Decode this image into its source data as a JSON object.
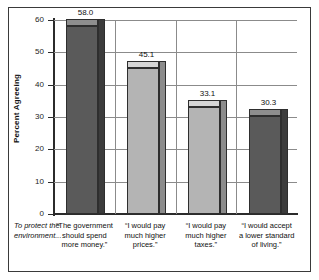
{
  "chart_data": {
    "type": "bar",
    "title": "",
    "xlabel": "",
    "ylabel": "Percent Agreeing",
    "ylim": [
      0,
      60
    ],
    "ytick_labels": [
      "0",
      "10",
      "20",
      "30",
      "40",
      "50",
      "60"
    ],
    "ytick_values": [
      0,
      10,
      20,
      30,
      40,
      50,
      60
    ],
    "grid": "horizontal-and-vertical",
    "legend": "none",
    "intro_label": "To protect the environment...",
    "categories": [
      "“The government should spend more money.”",
      "“I would pay much higher prices.”",
      "“I would pay much higher taxes.”",
      "“I would accept a lower standard of living.”"
    ],
    "category_lines": [
      [
        "“The government",
        "should spend",
        "more money.”"
      ],
      [
        "“I would pay",
        "much higher",
        "prices.”"
      ],
      [
        "“I would pay",
        "much higher",
        "taxes.”"
      ],
      [
        "“I would accept",
        "a lower standard",
        "of living.”"
      ]
    ],
    "values": [
      58.0,
      45.1,
      33.1,
      30.3
    ],
    "value_labels": [
      "58.0",
      "45.1",
      "33.1",
      "30.3"
    ],
    "bar_colors": [
      "#5a5a5a",
      "#b4b4b4",
      "#b4b4b4",
      "#5a5a5a"
    ]
  },
  "styling": {
    "frame_color": "#3a3a3a",
    "grid_color": "#8b8b8b",
    "axis_color": "#2b2b2b",
    "text_color": "#101010",
    "background": "#ffffff"
  }
}
